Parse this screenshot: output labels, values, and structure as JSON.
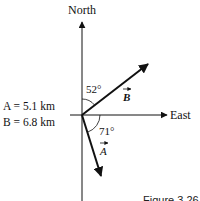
{
  "diagram": {
    "axes": {
      "north_label": "North",
      "east_label": "East"
    },
    "given": {
      "a_line": "A = 5.1 km",
      "b_line": "B = 6.8 km",
      "a_name": "A",
      "a_value": "5.1 km",
      "b_name": "B",
      "b_value": "6.8 km"
    },
    "vectors": [
      {
        "name": "B",
        "label": "B",
        "magnitude_km": 6.8,
        "angle_deg": 52,
        "angle_label": "52°",
        "reference": "measured from North toward East"
      },
      {
        "name": "A",
        "label": "A",
        "magnitude_km": 5.1,
        "angle_deg": 71,
        "angle_label": "71°",
        "reference": "measured from East toward South"
      }
    ],
    "caption": "Figure 3.26"
  }
}
